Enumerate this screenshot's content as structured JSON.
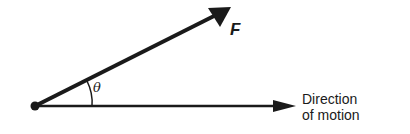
{
  "diagram": {
    "force_label": "F",
    "angle_label": "θ",
    "direction_label_line1": "Direction",
    "direction_label_line2": "of motion",
    "colors": {
      "stroke": "#1a1a1a",
      "background": "#ffffff"
    }
  }
}
